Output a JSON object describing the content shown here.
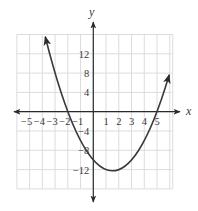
{
  "chart_data": {
    "type": "line",
    "title": "",
    "xlabel": "x",
    "ylabel": "y",
    "function": "y = x^2 - 3x - 10",
    "coefficients": {
      "a": 1,
      "b": -3,
      "c": -10
    },
    "x_range": [
      -3.77,
      5.96
    ],
    "xlim": [
      -6,
      6
    ],
    "ylim": [
      -16,
      16
    ],
    "grid": true,
    "grid_x_step": 1,
    "grid_y_step": 4,
    "x_ticks": [
      -5,
      -4,
      -3,
      -2,
      -1,
      1,
      2,
      3,
      4,
      5
    ],
    "x_tick_labels": [
      "−5",
      "−4",
      "−3",
      "−2",
      "−1",
      "1",
      "2",
      "3",
      "4",
      "5"
    ],
    "y_ticks": [
      12,
      8,
      4,
      -4,
      -8,
      -12
    ],
    "y_tick_labels": [
      "12",
      "8",
      "4",
      "−4",
      "−8",
      "−12"
    ],
    "key_points": {
      "x_intercepts": [
        [
          -2,
          0
        ],
        [
          5,
          0
        ]
      ],
      "y_intercept": [
        0,
        -10
      ],
      "vertex": [
        1.5,
        -12.25
      ]
    },
    "curve_arrows": "both ends",
    "legend": null
  },
  "colors": {
    "axis": "#2b2b2b",
    "curve": "#3a3a3a",
    "grid": "#dcdcdc",
    "text": "#3a3a3a"
  }
}
